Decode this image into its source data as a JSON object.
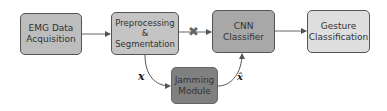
{
  "diagram": {
    "nodes": [
      {
        "id": "emg",
        "label": "EMG Data Acquisition",
        "line1": "EMG Data",
        "line2": "Acquisition",
        "fill": "#bdbdbd"
      },
      {
        "id": "pre",
        "label": "Preprocessing & Segmentation",
        "line1": "Preprocessing",
        "line2": "&",
        "line3": "Segmentation",
        "fill": "#c4c4c4"
      },
      {
        "id": "cnn",
        "label": "CNN Classifier",
        "line1": "CNN",
        "line2": "Classifier",
        "fill": "#a8a8a8"
      },
      {
        "id": "gest",
        "label": "Gesture Classification",
        "line1": "Gesture",
        "line2": "Classification",
        "fill": "#dedede"
      },
      {
        "id": "jam",
        "label": "Jamming Module",
        "line1": "Jamming",
        "line2": "Module",
        "fill": "#808080"
      }
    ],
    "edges": [
      {
        "from": "emg",
        "to": "pre"
      },
      {
        "from": "pre",
        "to": "cnn",
        "blocked": true
      },
      {
        "from": "cnn",
        "to": "gest"
      },
      {
        "from": "pre",
        "to": "jam",
        "label": "x"
      },
      {
        "from": "jam",
        "to": "cnn",
        "label": "x̂"
      }
    ],
    "labels": {
      "x": "x",
      "xhat": "x̂",
      "blocked_mark": "✖"
    }
  }
}
